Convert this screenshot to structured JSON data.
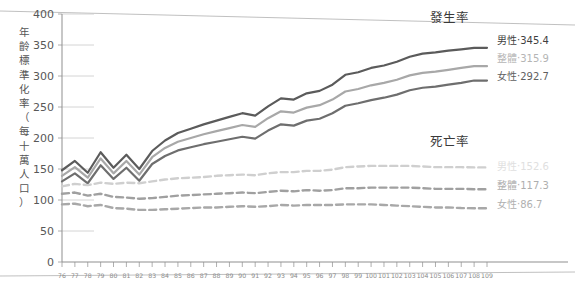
{
  "chart_data": {
    "type": "line",
    "title": "",
    "xlabel": "",
    "ylabel": "年齡標準化率（每十萬人口）",
    "xlim": [
      76,
      109
    ],
    "ylim": [
      0,
      400
    ],
    "grid": true,
    "legend_position": "right-inline",
    "y_ticks": [
      "0",
      "50",
      "100",
      "150",
      "200",
      "250",
      "300",
      "350",
      "400"
    ],
    "y_tick_values": [
      0,
      50,
      100,
      150,
      200,
      250,
      300,
      350,
      400
    ],
    "x": [
      76,
      77,
      78,
      79,
      80,
      81,
      82,
      83,
      84,
      85,
      86,
      87,
      88,
      89,
      90,
      91,
      92,
      93,
      94,
      95,
      96,
      97,
      98,
      99,
      100,
      101,
      102,
      103,
      104,
      105,
      106,
      107,
      108,
      109
    ],
    "x_tick_labels": [
      "76",
      "77",
      "78",
      "79",
      "80",
      "81",
      "82",
      "83",
      "84",
      "85",
      "86",
      "87",
      "88",
      "89",
      "90",
      "91",
      "92",
      "93",
      "94",
      "95",
      "96",
      "97",
      "98",
      "99",
      "100",
      "101",
      "102",
      "103",
      "104",
      "105",
      "106",
      "107",
      "108",
      "109"
    ],
    "group_headings": [
      {
        "key": "incidence",
        "label": "發生率"
      },
      {
        "key": "mortality",
        "label": "死亡率"
      }
    ],
    "series": [
      {
        "name": "發生率-男性",
        "group": "發生率",
        "label": "男性‧345.4",
        "end_value": 345.4,
        "style": "solid",
        "color": "#5b5b5b",
        "width": 2.2,
        "values": [
          148,
          163,
          144,
          177,
          152,
          173,
          150,
          179,
          196,
          208,
          215,
          222,
          228,
          234,
          240,
          236,
          251,
          264,
          262,
          272,
          276,
          286,
          302,
          306,
          313,
          317,
          323,
          331,
          336,
          338,
          341,
          343,
          345.4,
          345.4
        ]
      },
      {
        "name": "發生率-整體",
        "group": "發生率",
        "label": "整體‧315.9",
        "end_value": 315.9,
        "style": "solid",
        "color": "#a8a8a8",
        "width": 2.2,
        "values": [
          139,
          153,
          136,
          167,
          143,
          163,
          141,
          169,
          184,
          194,
          200,
          206,
          211,
          216,
          221,
          218,
          232,
          243,
          241,
          249,
          253,
          262,
          275,
          279,
          285,
          289,
          294,
          301,
          305,
          307,
          310,
          313,
          315.9,
          315.9
        ]
      },
      {
        "name": "發生率-女性",
        "group": "發生率",
        "label": "女性‧292.7",
        "end_value": 292.7,
        "style": "solid",
        "color": "#6e6e6e",
        "width": 2.2,
        "values": [
          130,
          143,
          127,
          156,
          134,
          152,
          131,
          158,
          171,
          180,
          185,
          190,
          194,
          198,
          202,
          199,
          212,
          222,
          220,
          228,
          231,
          240,
          252,
          256,
          261,
          265,
          270,
          277,
          281,
          283,
          286,
          289,
          292.7,
          292.7
        ]
      },
      {
        "name": "死亡率-男性",
        "group": "死亡率",
        "label": "男性‧152.6",
        "end_value": 152.6,
        "style": "dashed",
        "color": "#cfcfcf",
        "width": 2.4,
        "values": [
          122,
          126,
          124,
          128,
          126,
          128,
          127,
          130,
          133,
          135,
          136,
          137,
          139,
          140,
          141,
          140,
          143,
          145,
          145,
          147,
          147,
          149,
          153,
          154,
          155,
          155,
          155,
          155,
          154,
          153,
          153,
          153,
          152.6,
          152.6
        ]
      },
      {
        "name": "死亡率-整體",
        "group": "死亡率",
        "label": "整體‧117.3",
        "end_value": 117.3,
        "style": "dashed",
        "color": "#a0a0a0",
        "width": 2.4,
        "values": [
          110,
          112,
          107,
          110,
          105,
          104,
          102,
          103,
          105,
          107,
          108,
          109,
          110,
          111,
          112,
          111,
          113,
          115,
          114,
          116,
          115,
          116,
          119,
          119,
          120,
          120,
          120,
          120,
          119,
          118,
          118,
          118,
          117.3,
          117.3
        ]
      },
      {
        "name": "死亡率-女性",
        "group": "死亡率",
        "label": "女性‧86.7",
        "end_value": 86.7,
        "style": "dashed",
        "color": "#a8a8a8",
        "width": 2.4,
        "values": [
          93,
          94,
          90,
          92,
          87,
          86,
          84,
          84,
          85,
          86,
          87,
          88,
          88,
          89,
          90,
          89,
          90,
          92,
          91,
          92,
          92,
          92,
          93,
          93,
          93,
          92,
          91,
          90,
          89,
          88,
          88,
          87,
          86.7,
          86.7
        ]
      }
    ]
  },
  "colors": {
    "axis": "#8f8f8f",
    "grid": "#c9c9c9",
    "tick_text": "#8a8a8a",
    "heading_text": "#3a3a3a",
    "background": "#ffffff"
  }
}
